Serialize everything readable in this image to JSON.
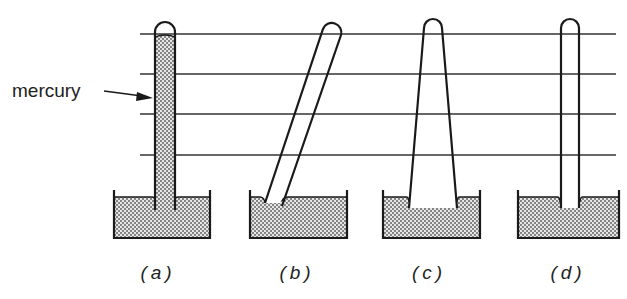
{
  "figure": {
    "annotation": {
      "text": "mercury",
      "points_to": "mercury column in tube (a)"
    },
    "reference_lines_y": [
      34,
      74,
      114,
      155
    ],
    "panels": [
      {
        "id": "a",
        "label": "(a)",
        "tube": "vertical, filled with mercury"
      },
      {
        "id": "b",
        "label": "(b)",
        "tube": "tilted"
      },
      {
        "id": "c",
        "label": "(c)",
        "tube": "tapered / widening"
      },
      {
        "id": "d",
        "label": "(d)",
        "tube": "vertical, narrow"
      }
    ]
  },
  "colors": {
    "ink": "#1a1a1a",
    "line": "#333333",
    "mercury_fill": "#cfcfcf",
    "background": "#ffffff"
  }
}
